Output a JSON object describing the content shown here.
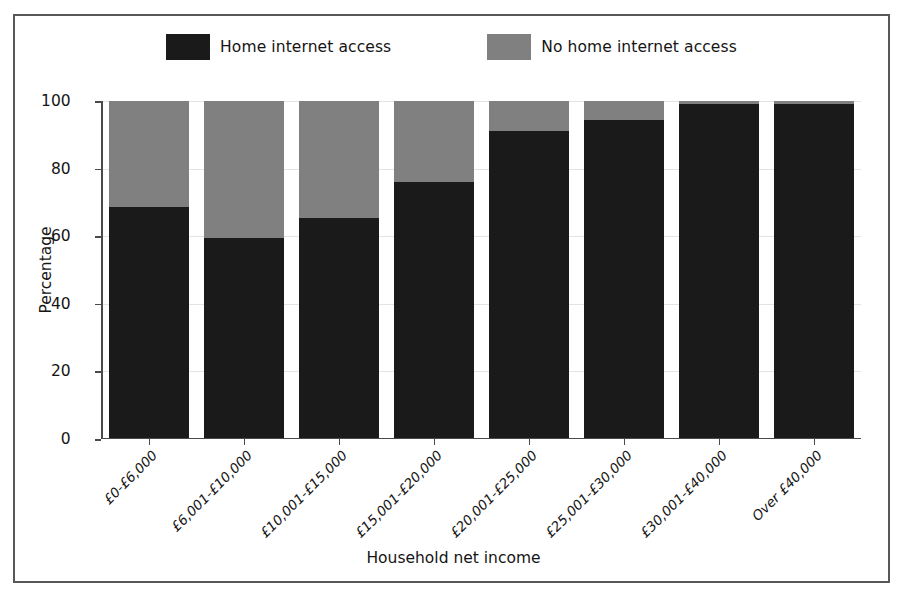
{
  "chart_data": {
    "type": "bar",
    "subtype": "stacked-percentage",
    "title": "",
    "xlabel": "Household net income",
    "ylabel": "Percentage",
    "ylim": [
      0,
      100
    ],
    "yticks": [
      0,
      20,
      40,
      60,
      80,
      100
    ],
    "ytick_labels": [
      "0",
      "20",
      "40",
      "60",
      "80",
      "100"
    ],
    "grid": true,
    "legend_position": "top",
    "categories": [
      "£0-£6,000",
      "£6,001-£10,000",
      "£10,001-£15,000",
      "£15,001-£20,000",
      "£20,001-£25,000",
      "£25,001-£30,000",
      "£30,001-£40,000",
      "Over £40,000"
    ],
    "series": [
      {
        "name": "Home internet access",
        "color": "#1a1a1a",
        "values": [
          68.5,
          59.5,
          65.5,
          76,
          91,
          94.5,
          99,
          99
        ]
      },
      {
        "name": "No home internet access",
        "color": "#808080",
        "values": [
          31.5,
          40.5,
          34.5,
          24,
          9,
          5.5,
          1,
          1
        ]
      }
    ]
  },
  "legend": {
    "entries": [
      {
        "label": "Home internet access",
        "color": "#1a1a1a"
      },
      {
        "label": "No home internet access",
        "color": "#808080"
      }
    ]
  },
  "axes": {
    "y_title": "Percentage",
    "x_title": "Household net income"
  },
  "colors": {
    "series_dark": "#1a1a1a",
    "series_gray": "#808080",
    "axis": "#4a4a4a",
    "grid": "#e3e3e3",
    "frame": "#58585a",
    "text": "#151515",
    "background": "#ffffff"
  }
}
